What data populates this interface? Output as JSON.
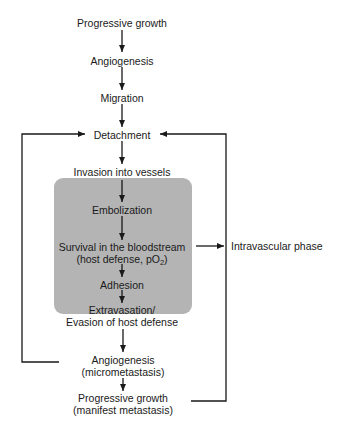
{
  "diagram": {
    "steps": [
      {
        "id": "s1",
        "label": "Progressive growth"
      },
      {
        "id": "s2",
        "label": "Angiogenesis"
      },
      {
        "id": "s3",
        "label": "Migration"
      },
      {
        "id": "s4",
        "label": "Detachment"
      },
      {
        "id": "s5",
        "label": "Invasion into vessels"
      },
      {
        "id": "s6",
        "label": "Embolization"
      },
      {
        "id": "s7",
        "line1": "Survival in the bloodstream",
        "line2_prefix": "(host defense, pO",
        "line2_sub": "2",
        "line2_suffix": ")"
      },
      {
        "id": "s8",
        "label": "Adhesion"
      },
      {
        "id": "s9",
        "line1": "Extravasation/",
        "line2": "Evasion of host defense"
      },
      {
        "id": "s10",
        "line1": "Angiogenesis",
        "line2": "(micrometastasis)"
      },
      {
        "id": "s11",
        "line1": "Progressive growth",
        "line2": "(manifest metastasis)"
      }
    ],
    "phase_label": "Intravascular phase",
    "colors": {
      "box_fill": "#b4b4b4",
      "line": "#1a1a1a",
      "text": "#1a1a1a"
    }
  }
}
